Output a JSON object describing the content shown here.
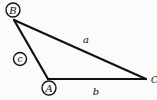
{
  "diagram": {
    "type": "triangle",
    "vertices": [
      {
        "id": "A",
        "label": "A",
        "circled": true
      },
      {
        "id": "B",
        "label": "B",
        "circled": true
      },
      {
        "id": "C",
        "label": "C",
        "circled": false
      }
    ],
    "sides": [
      {
        "id": "a",
        "label": "a",
        "from": "B",
        "to": "C",
        "circled": false
      },
      {
        "id": "b",
        "label": "b",
        "from": "A",
        "to": "C",
        "circled": false
      },
      {
        "id": "c",
        "label": "c",
        "from": "B",
        "to": "A",
        "circled": true
      }
    ],
    "colors": {
      "background": "#fbfbfb",
      "stroke": "#111111"
    }
  }
}
